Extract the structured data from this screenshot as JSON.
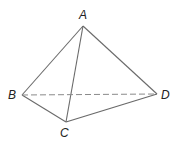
{
  "diagram": {
    "type": "tetrahedron",
    "vertices": {
      "A": {
        "label": "A",
        "x": 83,
        "y": 26,
        "lx": 79,
        "ly": 19
      },
      "B": {
        "label": "B",
        "x": 22,
        "y": 95,
        "lx": 8,
        "ly": 99
      },
      "C": {
        "label": "C",
        "x": 66,
        "y": 122,
        "lx": 60,
        "ly": 137
      },
      "D": {
        "label": "D",
        "x": 157,
        "y": 94,
        "lx": 161,
        "ly": 99
      }
    },
    "edges": [
      {
        "from": "A",
        "to": "B",
        "style": "solid"
      },
      {
        "from": "A",
        "to": "C",
        "style": "solid"
      },
      {
        "from": "A",
        "to": "D",
        "style": "solid"
      },
      {
        "from": "B",
        "to": "C",
        "style": "solid"
      },
      {
        "from": "C",
        "to": "D",
        "style": "solid"
      },
      {
        "from": "B",
        "to": "D",
        "style": "dashed"
      }
    ],
    "colors": {
      "line": "#6a6a6a",
      "label": "#222222"
    }
  }
}
